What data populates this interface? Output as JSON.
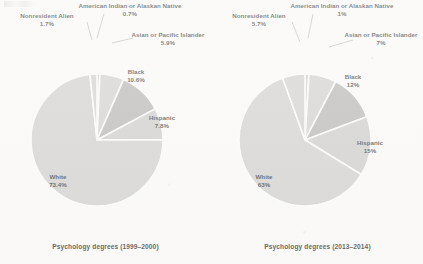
{
  "figure": {
    "background_color": "#fbfbfa",
    "slice_line_color": "#fdfdfc",
    "leader_line_color": "#9a9a9a",
    "corner_smudge_name": "scan-artifact"
  },
  "chart_data": [
    {
      "type": "pie",
      "title": "Psychology degrees (1999–2000)",
      "caption": "Psychology degrees (1999–2000)",
      "legend": "none",
      "labels_inline": true,
      "categories": [
        "American Indian or Alaskan Native",
        "Asian or Pacific Islander",
        "Black",
        "Hispanic",
        "White",
        "Nonresident Alien"
      ],
      "values": [
        0.7,
        5.9,
        10.6,
        7.8,
        73.4,
        1.7
      ],
      "value_labels": [
        "0.7%",
        "5.9%",
        "10.6%",
        "7.8%",
        "73.4%",
        "1.7%"
      ],
      "colors": [
        "#c9c9c9",
        "#c9c9c9",
        "#a9a9a9",
        "#c4c4c4",
        "#c9c9c9",
        "#c9c9c9"
      ],
      "start_angle_deg": 0,
      "direction": "clockwise",
      "units": "percent"
    },
    {
      "type": "pie",
      "title": "Psychology degrees (2013–2014)",
      "caption": "Psychology degrees (2013–2014)",
      "legend": "none",
      "labels_inline": true,
      "categories": [
        "American Indian or Alaskan Native",
        "Asian or Pacific Islander",
        "Black",
        "Hispanic",
        "White",
        "Nonresident Alien"
      ],
      "values": [
        1,
        7,
        12,
        15,
        63,
        5.7
      ],
      "value_labels": [
        "1%",
        "7%",
        "12%",
        "15%",
        "63%",
        "5.7%"
      ],
      "colors": [
        "#c9c9c9",
        "#c9c9c9",
        "#a9a9a9",
        "#c4c4c4",
        "#c9c9c9",
        "#c9c9c9"
      ],
      "start_angle_deg": 0,
      "direction": "clockwise",
      "units": "percent"
    }
  ],
  "left_chart": {
    "caption": "Psychology degrees (1999–2000)",
    "labels": {
      "nonresident_alien": {
        "name": "Nonresident Alien",
        "pct": "1.7%"
      },
      "american_indian": {
        "name": "American Indian or Alaskan Native",
        "pct": "0.7%"
      },
      "asian_pacific": {
        "name": "Asian or Pacific Islander",
        "pct": "5.9%"
      },
      "black": {
        "name": "Black",
        "pct": "10.6%"
      },
      "hispanic": {
        "name": "Hispanic",
        "pct": "7.8%"
      },
      "white": {
        "name": "White",
        "pct": "73.4%"
      }
    }
  },
  "right_chart": {
    "caption": "Psychology degrees (2013–2014)",
    "labels": {
      "nonresident_alien": {
        "name": "Nonresident Alien",
        "pct": "5.7%"
      },
      "american_indian": {
        "name": "American Indian or Alaskan Native",
        "pct": "1%"
      },
      "asian_pacific": {
        "name": "Asian or Pacific Islander",
        "pct": "7%"
      },
      "black": {
        "name": "Black",
        "pct": "12%"
      },
      "hispanic": {
        "name": "Hispanic",
        "pct": "15%"
      },
      "white": {
        "name": "White",
        "pct": "63%"
      }
    }
  }
}
